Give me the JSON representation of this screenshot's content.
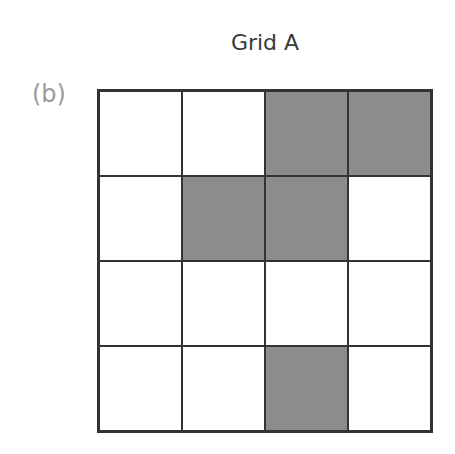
{
  "title": "Grid A",
  "panel_label": "(b)",
  "colors": {
    "filled": "#8c8c8c",
    "empty": "#ffffff",
    "line": "#333333",
    "label": "#9a9a9a"
  },
  "grid": {
    "rows": 4,
    "cols": 4,
    "cells": [
      [
        0,
        0,
        1,
        1
      ],
      [
        0,
        1,
        1,
        0
      ],
      [
        0,
        0,
        0,
        0
      ],
      [
        0,
        0,
        1,
        0
      ]
    ]
  }
}
